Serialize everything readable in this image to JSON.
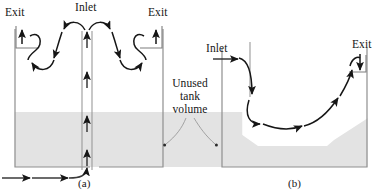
{
  "figure": {
    "title": "",
    "caption_a": "(a)",
    "caption_b": "(b)"
  },
  "colors": {
    "line": "#161616",
    "tank_wall": "#8c8c8c",
    "liquid_fill": "#e3e3e3",
    "background": "#ffffff",
    "leader": "#9a9a9a"
  },
  "panel_a": {
    "caption": "(a)",
    "labels": {
      "exit_left": "Exit",
      "inlet_top": "Inlet",
      "exit_right": "Exit"
    },
    "tanks": [
      {
        "name": "left-tank",
        "x": 14,
        "y": 28,
        "width": 149,
        "height": 139,
        "liquid_top": 112
      },
      {
        "name": "right-tank",
        "x": 94,
        "y": 28,
        "width": 149,
        "height": 139,
        "liquid_top": 112
      }
    ],
    "inlet_pipe": {
      "orientation": "vertical",
      "flow": "upward",
      "arrow_count": 4
    },
    "feed_line": {
      "orientation": "horizontal",
      "flow": "rightward",
      "arrow_count": 2
    }
  },
  "panel_b": {
    "caption": "(b)",
    "labels": {
      "inlet": "Inlet",
      "exit": "Exit"
    },
    "tank": {
      "name": "tank-b",
      "x": 221,
      "y": 47,
      "width": 147,
      "height": 120
    },
    "liquid_profile": "trough",
    "flow": "single-circulation-loop"
  },
  "annotation": {
    "unused_volume": {
      "line1": "Unused",
      "line2": "tank",
      "line3": "volume",
      "leader_targets": 2
    }
  }
}
